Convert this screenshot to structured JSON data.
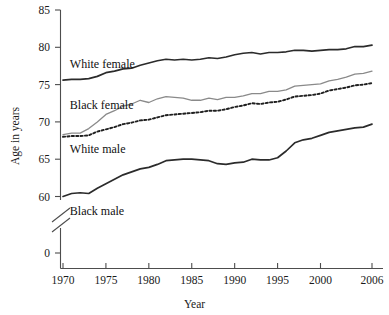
{
  "chart_data": {
    "type": "line",
    "title": "",
    "xlabel": "Year",
    "ylabel": "Age in years",
    "xlim": [
      1970,
      2006
    ],
    "ylim": [
      60,
      85
    ],
    "y_axis_break": true,
    "y_zero_label": "0",
    "grid": false,
    "legend_position": "inline-labels",
    "x_ticks": [
      "1970",
      "1975",
      "1980",
      "1985",
      "1990",
      "1995",
      "2000",
      "2006"
    ],
    "x_tick_values": [
      1970,
      1975,
      1980,
      1985,
      1990,
      1995,
      2000,
      2006
    ],
    "y_ticks": [
      "60",
      "65",
      "70",
      "75",
      "80",
      "85"
    ],
    "y_tick_values": [
      60,
      65,
      70,
      75,
      80,
      85
    ],
    "x": [
      1970,
      1971,
      1972,
      1973,
      1974,
      1975,
      1976,
      1977,
      1978,
      1979,
      1980,
      1981,
      1982,
      1983,
      1984,
      1985,
      1986,
      1987,
      1988,
      1989,
      1990,
      1991,
      1992,
      1993,
      1994,
      1995,
      1996,
      1997,
      1998,
      1999,
      2000,
      2001,
      2002,
      2003,
      2004,
      2005,
      2006
    ],
    "series": [
      {
        "name": "White female",
        "label": "White female",
        "color": "#2b2b2b",
        "style": "solid",
        "width": 1.7,
        "values": [
          75.6,
          75.7,
          75.7,
          75.8,
          76.1,
          76.6,
          76.8,
          77.1,
          77.2,
          77.6,
          77.9,
          78.2,
          78.4,
          78.3,
          78.4,
          78.3,
          78.4,
          78.6,
          78.5,
          78.7,
          79.0,
          79.2,
          79.3,
          79.1,
          79.3,
          79.3,
          79.4,
          79.6,
          79.6,
          79.5,
          79.6,
          79.7,
          79.7,
          79.8,
          80.1,
          80.1,
          80.3
        ]
      },
      {
        "name": "Black female",
        "label": "Black female",
        "color": "#8a8a8a",
        "style": "solid",
        "width": 1.3,
        "values": [
          68.3,
          68.5,
          68.5,
          69.1,
          70.0,
          71.0,
          71.5,
          72.1,
          72.4,
          72.9,
          72.6,
          73.1,
          73.4,
          73.3,
          73.2,
          72.9,
          72.9,
          73.2,
          73.0,
          73.3,
          73.3,
          73.5,
          73.8,
          73.8,
          74.1,
          74.1,
          74.3,
          74.8,
          74.9,
          75.0,
          75.1,
          75.5,
          75.7,
          76.0,
          76.4,
          76.5,
          76.8
        ],
        "note": "plotted to ~75.2 on this figure's scale"
      },
      {
        "name": "White male",
        "label": "White male",
        "color": "#1f1f1f",
        "style": "dotted",
        "width": 1.9,
        "values": [
          68.0,
          68.1,
          68.1,
          68.2,
          68.7,
          69.0,
          69.3,
          69.7,
          69.9,
          70.2,
          70.3,
          70.6,
          70.9,
          71.0,
          71.1,
          71.2,
          71.3,
          71.5,
          71.5,
          71.7,
          72.0,
          72.2,
          72.5,
          72.4,
          72.6,
          72.7,
          73.0,
          73.4,
          73.5,
          73.6,
          73.8,
          74.2,
          74.4,
          74.6,
          74.9,
          75.0,
          75.2
        ]
      },
      {
        "name": "Black male",
        "label": "Black male",
        "color": "#2b2b2b",
        "style": "solid",
        "width": 1.7,
        "values": [
          60.0,
          60.4,
          60.5,
          60.4,
          61.1,
          61.7,
          62.3,
          62.9,
          63.3,
          63.7,
          63.9,
          64.3,
          64.8,
          64.9,
          65.0,
          65.0,
          64.9,
          64.8,
          64.4,
          64.3,
          64.5,
          64.6,
          65.0,
          64.9,
          64.9,
          65.2,
          66.1,
          67.2,
          67.6,
          67.8,
          68.2,
          68.6,
          68.8,
          69.0,
          69.2,
          69.3,
          69.7
        ]
      }
    ],
    "series_label_positions": [
      {
        "name": "White female",
        "x": 1970.8,
        "y_px": 68
      },
      {
        "name": "Black female",
        "x": 1970.8,
        "y_px": 109
      },
      {
        "name": "White male",
        "x": 1970.8,
        "y_px": 153
      },
      {
        "name": "Black male",
        "x": 1970.8,
        "y_px": 215
      }
    ]
  }
}
